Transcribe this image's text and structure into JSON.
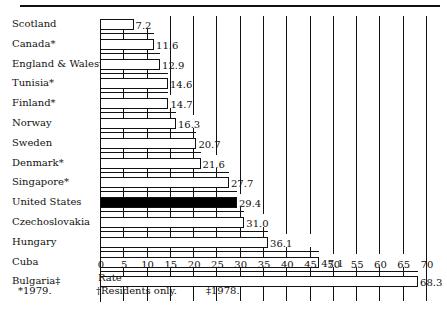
{
  "chart_data": {
    "type": "bar",
    "orientation": "horizontal",
    "title": "",
    "xlabel": "Rate",
    "ylabel": "",
    "xlim": [
      0,
      70
    ],
    "xticks": [
      0,
      5,
      10,
      15,
      20,
      25,
      30,
      35,
      40,
      45,
      50,
      55,
      60,
      65,
      70
    ],
    "categories": [
      "Scotland",
      "Canada*",
      "England & Wales†",
      "Tunisia*",
      "Finland*",
      "Norway",
      "Sweden",
      "Denmark*",
      "Singapore*",
      "United States",
      "Czechoslovakia",
      "Hungary",
      "Cuba",
      "Bulgaria‡"
    ],
    "values": [
      7.2,
      11.6,
      12.9,
      14.6,
      14.7,
      16.3,
      20.7,
      21.6,
      27.7,
      29.4,
      31.0,
      36.1,
      47.1,
      68.3
    ],
    "value_labels": [
      "7.2",
      "11.6",
      "12.9",
      "14.6",
      "14.7",
      "16.3",
      "20.7",
      "21.6",
      "27.7",
      "29.4",
      "31.0",
      "36.1",
      "47.1",
      "68.3"
    ],
    "highlight": "United States",
    "grid": false,
    "legend": null,
    "footnotes": [
      "*1979.",
      "†Residents only.",
      "‡1978."
    ]
  }
}
